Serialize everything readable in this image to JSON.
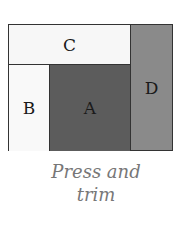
{
  "diagram": {
    "regions": [
      {
        "id": "C",
        "label": "C",
        "color": "#f7f7f7"
      },
      {
        "id": "B",
        "label": "B",
        "color": "#f9f9f9"
      },
      {
        "id": "A",
        "label": "A",
        "color": "#5c5c5c"
      },
      {
        "id": "D",
        "label": "D",
        "color": "#8a8a8a"
      }
    ]
  },
  "caption": {
    "line1": "Press and",
    "line2": "trim"
  }
}
